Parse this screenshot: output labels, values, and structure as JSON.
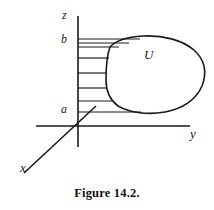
{
  "figure": {
    "caption": "Figure 14.2.",
    "region_label": "U",
    "axes": {
      "z": {
        "label": "z",
        "x": 78,
        "y_top": 16,
        "y_bottom": 147
      },
      "y": {
        "label": "y",
        "y": 126,
        "x_left": 36,
        "x_right": 190
      },
      "x": {
        "label": "x",
        "x1": 24,
        "y1": 173,
        "x2": 96,
        "y2": 106
      }
    },
    "marks": [
      {
        "name": "b",
        "label": "b",
        "z": 39
      },
      {
        "name": "a",
        "label": "a",
        "z": 112
      }
    ],
    "hatch_lines": [
      {
        "y": 39,
        "x_start": 78,
        "x_end": 140
      },
      {
        "y": 43,
        "x_start": 78,
        "x_end": 128
      },
      {
        "y": 47,
        "x_start": 78,
        "x_end": 118
      },
      {
        "y": 58,
        "x_start": 78,
        "x_end": 109
      },
      {
        "y": 73,
        "x_start": 78,
        "x_end": 106
      },
      {
        "y": 88,
        "x_start": 78,
        "x_end": 107
      },
      {
        "y": 101,
        "x_start": 78,
        "x_end": 112
      },
      {
        "y": 112,
        "x_start": 78,
        "x_end": 140
      }
    ],
    "blob": {
      "name": "U",
      "path": "M 110 47 C 116 41 128 37 143 36 C 163 35 182 40 194 50 C 204 59 206 72 202 85 C 197 99 183 109 166 112 C 149 115 131 113 119 106 C 110 100 106 91 106 80 C 106 70 107 58 110 47 Z"
    },
    "colors": {
      "ink": "#1a1a1a",
      "background": "#ffffff"
    }
  }
}
